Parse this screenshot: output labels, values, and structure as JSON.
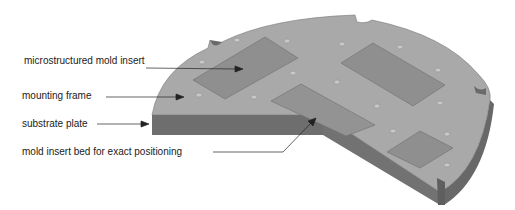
{
  "labels": [
    {
      "id": "mold-insert",
      "text": "microstructured mold insert"
    },
    {
      "id": "mounting-frame",
      "text": "mounting frame"
    },
    {
      "id": "substrate-plate",
      "text": "substrate plate"
    },
    {
      "id": "insert-bed",
      "text": "mold insert bed for exact positioning"
    }
  ],
  "colors": {
    "top_surface": "#a9a9a9",
    "insert": "#8f8f8f",
    "side_face": "#6e6e6e",
    "outline": "#555555",
    "text": "#222222"
  }
}
